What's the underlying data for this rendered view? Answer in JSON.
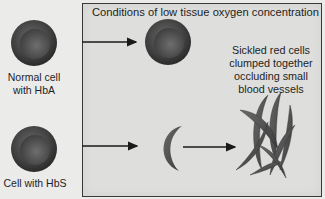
{
  "title": "Conditions of low tissue oxygen concentration",
  "left_labels": {
    "normal": [
      "Normal cell",
      "with HbA"
    ],
    "sickle": "Cell with HbS"
  },
  "annotation": [
    "Sickled red cells",
    "clumped together",
    "occluding small",
    "blood vessels"
  ],
  "colors": {
    "background": "#ebebea",
    "panel": "#dededc",
    "cell_outer": "#3d3d3d",
    "cell_inner": "#5a5a5a",
    "sickle": "#555555"
  }
}
